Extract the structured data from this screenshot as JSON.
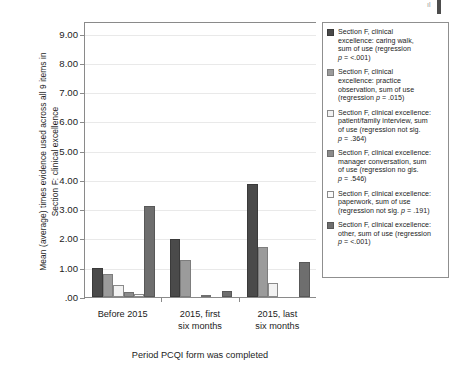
{
  "chart_data": {
    "type": "bar",
    "title": "",
    "categories": [
      "Before 2015",
      "2015, first six months",
      "2015, last six months"
    ],
    "category_lines": [
      [
        "Before 2015"
      ],
      [
        "2015, first",
        "six months"
      ],
      [
        "2015, last",
        "six months"
      ]
    ],
    "series": [
      {
        "name": "Section F, clinical excellence: caring walk, sum of use (regression p = <.001)",
        "short_name": "caring walk",
        "color": "#4a4a4a",
        "border": "#3a3a3a",
        "values": [
          1.0,
          2.0,
          3.85
        ]
      },
      {
        "name": "Section F, clinical excellence: practice observation, sum of use (regression p = .015)",
        "short_name": "practice observation",
        "color": "#9b9b9b",
        "border": "#7d7d7d",
        "values": [
          0.78,
          1.28,
          1.7
        ]
      },
      {
        "name": "Section F, clinical excellence: patient/family interview, sum of use (regression not sig. p = .364)",
        "short_name": "patient/family interview",
        "color": "#f2f2f2",
        "border": "#8a8a8a",
        "values": [
          0.42,
          0.0,
          0.48
        ]
      },
      {
        "name": "Section F, clinical excellence: manager conversation, sum of use (regression no gis. p = .546)",
        "short_name": "manager conversation",
        "color": "#8b8b8b",
        "border": "#6f6f6f",
        "values": [
          0.17,
          0.05,
          0.0
        ]
      },
      {
        "name": "Section F, clinical excellence: paperwork, sum of use (regression not sig. p = .191)",
        "short_name": "paperwork",
        "color": "#fbfbfb",
        "border": "#8a8a8a",
        "values": [
          0.11,
          0.0,
          0.0
        ]
      },
      {
        "name": "Section F, clinical excellence: other, sum of use (regression p = <.001)",
        "short_name": "other",
        "color": "#6e6e6e",
        "border": "#585858",
        "values": [
          3.12,
          0.22,
          1.18
        ]
      }
    ],
    "ylabel": "Mean (average) times evidence used across all 9 items in\nSection F: clinical excellence",
    "xlabel": "Period PCQI form was completed",
    "ylim": [
      0,
      9.4
    ],
    "yticks": [
      0,
      1,
      2,
      3,
      4,
      5,
      6,
      7,
      8,
      9
    ],
    "ytick_labels": [
      ".00",
      "1.00",
      "2.00",
      "3.00",
      "4.00",
      "5.00",
      "6.00",
      "7.00",
      "8.00",
      "9.00"
    ],
    "grid": true,
    "legend_position": "right"
  },
  "legend": {
    "items": [
      {
        "swatch": "#4a4a4a",
        "border": "#3a3a3a",
        "line1": "Section F, clinical",
        "line2": "excellence: caring walk,",
        "line3": "sum of use (regression",
        "line4": "p = <.001)"
      },
      {
        "swatch": "#9b9b9b",
        "border": "#7d7d7d",
        "line1": "Section F, clinical",
        "line2": "excellence: practice",
        "line3": "observation, sum of use",
        "line4": "(regression p = .015)"
      },
      {
        "swatch": "#f2f2f2",
        "border": "#8a8a8a",
        "line1": "Section F, clinical excellence:",
        "line2": "patient/family interview, sum",
        "line3": "of use (regression not sig.",
        "line4": "p = .364)"
      },
      {
        "swatch": "#8b8b8b",
        "border": "#6f6f6f",
        "line1": "Section F, clinical excellence:",
        "line2": "manager conversation, sum",
        "line3": "of use (regression no gis.",
        "line4": "p = .546)"
      },
      {
        "swatch": "#fbfbfb",
        "border": "#8a8a8a",
        "line1": "Section F, clinical excellence:",
        "line2": "paperwork, sum of use",
        "line3": "(regression not sig. p = .191)",
        "line4": ""
      },
      {
        "swatch": "#6e6e6e",
        "border": "#585858",
        "line1": "Section F, clinical excellence:",
        "line2": "other, sum of use (regression",
        "line3": "p = <.001)",
        "line4": ""
      }
    ]
  }
}
